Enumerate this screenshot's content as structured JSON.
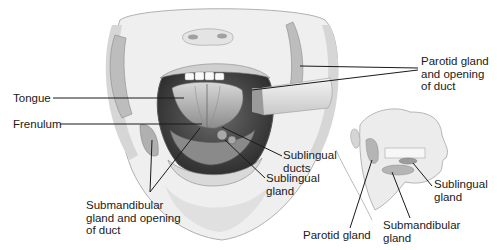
{
  "figure": {
    "type": "anatomical illustration",
    "colors": {
      "line": "#1a1a1a",
      "skin": "#ececec",
      "shadow": "#9a9a9a",
      "gland": "#b5b5b5",
      "background": "#ffffff"
    }
  },
  "main_view": {
    "labels": {
      "tongue": "Tongue",
      "frenulum": "Frenulum",
      "parotid": "Parotid gland\nand opening\nof duct",
      "sublingual_ducts": "Sublingual\nducts",
      "sublingual_gland": "Sublingual\ngland",
      "submandibular": "Submandibular\ngland and opening\nof duct"
    }
  },
  "inset_view": {
    "labels": {
      "parotid": "Parotid gland",
      "submandibular": "Submandibular\ngland",
      "sublingual": "Sublingual\ngland"
    }
  }
}
